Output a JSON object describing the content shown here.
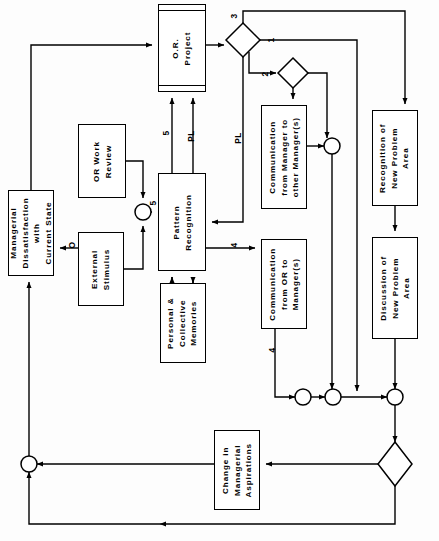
{
  "diagram": {
    "stroke_color": "#000000",
    "fill_color": "#ffffff",
    "background": "#fdfdfd",
    "text_orientation": "rotated-90-ccw"
  },
  "nodes": [
    {
      "id": "or_project",
      "label": "O.R.\nProject",
      "shape": "subroutine-box",
      "x": 158,
      "y": 4,
      "w": 48,
      "h": 88
    },
    {
      "id": "or_work_review",
      "label": "OR Work\nReview",
      "shape": "box",
      "x": 78,
      "y": 124,
      "w": 48,
      "h": 74
    },
    {
      "id": "managerial_dissat",
      "label": "Managerial\nDissatisfaction\nwith\nCurrent State",
      "shape": "box",
      "x": 8,
      "y": 190,
      "w": 46,
      "h": 86
    },
    {
      "id": "external_stimulus",
      "label": "External\nStimulus",
      "shape": "box",
      "x": 78,
      "y": 232,
      "w": 46,
      "h": 74
    },
    {
      "id": "pattern_recog",
      "label": "Pattern\nRecognition",
      "shape": "box",
      "x": 158,
      "y": 173,
      "w": 48,
      "h": 98
    },
    {
      "id": "memories",
      "label": "Personal &\nCollective\nMemories",
      "shape": "box",
      "x": 160,
      "y": 283,
      "w": 46,
      "h": 80
    },
    {
      "id": "comm_mgr_mgr",
      "label": "Communication\nfrom Manager to\nother Manager(s)",
      "shape": "box",
      "x": 261,
      "y": 105,
      "w": 46,
      "h": 104
    },
    {
      "id": "comm_or_mgr",
      "label": "Communication\nfrom OR to\nManager(s)",
      "shape": "box",
      "x": 261,
      "y": 239,
      "w": 46,
      "h": 90
    },
    {
      "id": "recog_new_problem",
      "label": "Recognition of\nNew Problem\nArea",
      "shape": "box",
      "x": 372,
      "y": 110,
      "w": 46,
      "h": 96
    },
    {
      "id": "discuss_new_problem",
      "label": "Discussion of\nNew Problem\nArea",
      "shape": "box",
      "x": 372,
      "y": 237,
      "w": 46,
      "h": 102
    },
    {
      "id": "change_aspirations",
      "label": "Change in\nManagerial\nAspirations",
      "shape": "box",
      "x": 214,
      "y": 430,
      "w": 46,
      "h": 80
    }
  ],
  "decisions": [
    {
      "id": "d1",
      "cx": 243,
      "cy": 40,
      "rx": 17,
      "ry": 17,
      "label": ""
    },
    {
      "id": "d2",
      "cx": 293,
      "cy": 73,
      "rx": 15,
      "ry": 15,
      "label": ""
    },
    {
      "id": "d3",
      "cx": 395,
      "cy": 464,
      "rx": 17,
      "ry": 22,
      "label": ""
    }
  ],
  "junctions": [
    {
      "id": "j_sum_left",
      "cx": 143,
      "cy": 212,
      "r": 8
    },
    {
      "id": "j_comm_mgr",
      "cx": 332,
      "cy": 146,
      "r": 8
    },
    {
      "id": "j_row_a",
      "cx": 303,
      "cy": 397,
      "r": 8
    },
    {
      "id": "j_row_b",
      "cx": 333,
      "cy": 397,
      "r": 8
    },
    {
      "id": "j_row_c",
      "cx": 395,
      "cy": 397,
      "r": 8
    },
    {
      "id": "j_bottom_left",
      "cx": 29,
      "cy": 464,
      "r": 8
    }
  ],
  "edge_labels": [
    {
      "id": "lbl_3",
      "text": "3",
      "x": 231,
      "y": 11
    },
    {
      "id": "lbl_1",
      "text": "1",
      "x": 268,
      "y": 35
    },
    {
      "id": "lbl_2",
      "text": "2",
      "x": 262,
      "y": 69
    },
    {
      "id": "lbl_5_up",
      "text": "5",
      "x": 167,
      "y": 128
    },
    {
      "id": "lbl_pl_a",
      "text": "PL",
      "x": 193,
      "y": 131
    },
    {
      "id": "lbl_pl_b",
      "text": "PL",
      "x": 235,
      "y": 133
    },
    {
      "id": "lbl_5_sum",
      "text": "5",
      "x": 154,
      "y": 203
    },
    {
      "id": "lbl_o",
      "text": "O",
      "x": 73,
      "y": 243
    },
    {
      "id": "lbl_4_pr",
      "text": "4",
      "x": 231,
      "y": 240
    },
    {
      "id": "lbl_4_comm",
      "text": "4",
      "x": 275,
      "y": 345
    }
  ]
}
